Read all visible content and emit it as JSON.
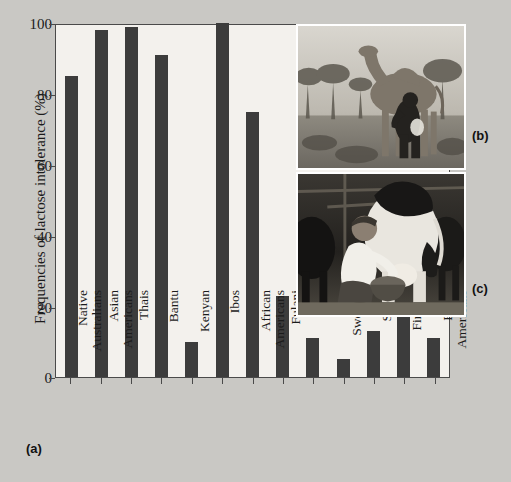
{
  "chart_data": {
    "type": "bar",
    "title": "",
    "xlabel": "",
    "ylabel": "Frequencies of lactose intolerance (%)",
    "ylim": [
      0,
      100
    ],
    "yticks": [
      0,
      20,
      40,
      60,
      80,
      100
    ],
    "grid": false,
    "legend": null,
    "categories": [
      "Native\nAustralians",
      "Asian\nAmericans",
      "Thais",
      "Bantu",
      "Kenyan",
      "Ibos",
      "African\nAmericans",
      "Fulani",
      "Tutsi",
      "Swedish",
      "Swiss",
      "Finnish",
      "Euro-\nAmericans"
    ],
    "values": [
      85,
      98,
      99,
      91,
      10,
      100,
      75,
      23,
      11,
      5,
      13,
      19,
      11
    ],
    "bar_color": "#3c3c3c"
  },
  "figure": {
    "background_color": "#c9c8c4",
    "plot_background_color": "#f3f1ed",
    "axis_color": "#4a4a4a",
    "panels": [
      {
        "letter": "(a)",
        "name": "bar-chart-panel"
      },
      {
        "letter": "(b)",
        "name": "camel-milking-photo-panel"
      },
      {
        "letter": "(c)",
        "name": "cow-milking-photo-panel"
      }
    ],
    "photo_b_caption": "camel being milked in acacia savanna",
    "photo_c_caption": "man milking a Holstein dairy cow in a barn"
  }
}
